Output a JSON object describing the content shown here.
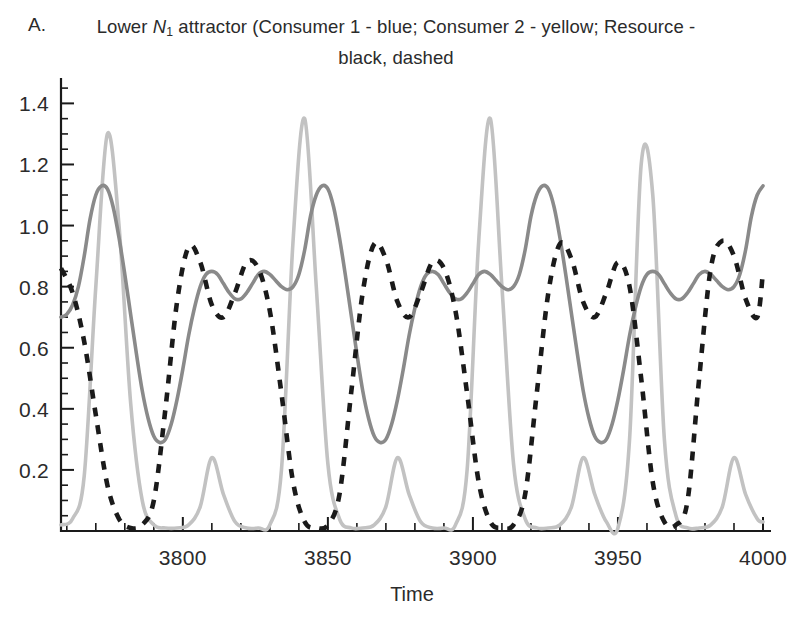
{
  "figure": {
    "panel_letter": "A.",
    "caption_prefix": "Lower ",
    "caption_var": "N",
    "caption_var_sub": "1",
    "caption_rest": " attractor (Consumer 1 - blue; Consumer 2 - yellow; Resource - black, dashed"
  },
  "chart_data": {
    "type": "line",
    "title": "Lower N1 attractor (Consumer 1 - blue; Consumer 2 - yellow; Resource - black, dashed",
    "xlabel": "Time",
    "ylabel": "",
    "xlim": [
      3758,
      4000
    ],
    "ylim": [
      0,
      1.47
    ],
    "grid": false,
    "legend_position": "none",
    "legend_in_title": true,
    "xticks_major": [
      3800,
      3850,
      3900,
      3950,
      4000
    ],
    "xticks_major_labels": [
      "3800",
      "3850",
      "3900",
      "3950",
      "4000"
    ],
    "xtick_minor_step": 10,
    "yticks_major": [
      0.2,
      0.4,
      0.6,
      0.8,
      1.0,
      1.2,
      1.4
    ],
    "yticks_major_labels": [
      "0.2",
      "0.4",
      "0.6",
      "0.8",
      "1.0",
      "1.2",
      "1.4"
    ],
    "ytick_minor_step": 0.05,
    "axis_style": "left-and-bottom-spines",
    "colors": {
      "consumer1": "#8a8a8a",
      "consumer2": "#c2c2c2",
      "resource": "#1a1a1a",
      "axis": "#1a1a1a",
      "text": "#2b2b2b",
      "background": "#ffffff"
    },
    "period": 62,
    "series": [
      {
        "name": "Consumer 1",
        "legend_label": "Consumer 1 - blue",
        "style": "solid",
        "color": "#8a8a8a",
        "x": [
          3758,
          3760,
          3762,
          3764,
          3766,
          3768,
          3770,
          3772,
          3774,
          3776,
          3778,
          3780,
          3782,
          3784,
          3786,
          3788,
          3790,
          3792,
          3794,
          3796,
          3798,
          3800,
          3802,
          3804,
          3806,
          3808,
          3810,
          3812,
          3814,
          3816,
          3818,
          3820,
          3822,
          3824,
          3826,
          3828,
          3830,
          3832,
          3834,
          3836,
          3838,
          3840,
          3842,
          3844,
          3846,
          3848,
          3850,
          3852,
          3854,
          3856,
          3858,
          3860,
          3862,
          3864,
          3866,
          3868,
          3870,
          3872,
          3874,
          3876,
          3878,
          3880,
          3882,
          3884,
          3886,
          3888,
          3890,
          3892,
          3894,
          3896,
          3898,
          3900,
          3902,
          3904,
          3906,
          3908,
          3910,
          3912,
          3914,
          3916,
          3918,
          3920,
          3922,
          3924,
          3926,
          3928,
          3930,
          3932,
          3934,
          3936,
          3938,
          3940,
          3942,
          3944,
          3946,
          3948,
          3950,
          3952,
          3954,
          3956,
          3958,
          3960,
          3962,
          3964,
          3966,
          3968,
          3970,
          3972,
          3974,
          3976,
          3978,
          3980,
          3982,
          3984,
          3986,
          3988,
          3990,
          3992,
          3994,
          3996,
          3998,
          4000
        ],
        "y": [
          0.7,
          0.71,
          0.74,
          0.8,
          0.9,
          1.02,
          1.1,
          1.13,
          1.12,
          1.06,
          0.96,
          0.84,
          0.71,
          0.58,
          0.46,
          0.37,
          0.31,
          0.29,
          0.3,
          0.35,
          0.43,
          0.53,
          0.64,
          0.73,
          0.8,
          0.84,
          0.85,
          0.84,
          0.81,
          0.78,
          0.76,
          0.76,
          0.78,
          0.81,
          0.84,
          0.85,
          0.84,
          0.82,
          0.8,
          0.79,
          0.8,
          0.84,
          0.92,
          1.03,
          1.1,
          1.13,
          1.12,
          1.06,
          0.96,
          0.84,
          0.71,
          0.58,
          0.46,
          0.37,
          0.31,
          0.29,
          0.3,
          0.35,
          0.43,
          0.53,
          0.64,
          0.73,
          0.8,
          0.84,
          0.85,
          0.84,
          0.81,
          0.78,
          0.76,
          0.76,
          0.78,
          0.81,
          0.84,
          0.85,
          0.84,
          0.82,
          0.8,
          0.79,
          0.8,
          0.84,
          0.92,
          1.03,
          1.1,
          1.13,
          1.12,
          1.06,
          0.96,
          0.84,
          0.71,
          0.58,
          0.46,
          0.37,
          0.31,
          0.29,
          0.3,
          0.35,
          0.43,
          0.53,
          0.64,
          0.73,
          0.8,
          0.84,
          0.85,
          0.84,
          0.81,
          0.78,
          0.76,
          0.76,
          0.78,
          0.81,
          0.84,
          0.85,
          0.84,
          0.82,
          0.8,
          0.79,
          0.8,
          0.84,
          0.92,
          1.03,
          1.1,
          1.13
        ]
      },
      {
        "name": "Consumer 2",
        "legend_label": "Consumer 2 - yellow",
        "style": "solid",
        "color": "#c2c2c2",
        "peak_high": 1.39,
        "peak_low": 0.25,
        "x": [
          3758,
          3762,
          3766,
          3770,
          3774,
          3778,
          3782,
          3786,
          3790,
          3794,
          3798,
          3802,
          3806,
          3810,
          3814,
          3818,
          3822,
          3826,
          3830,
          3834,
          3838,
          3842,
          3846,
          3850,
          3854,
          3858,
          3862,
          3866,
          3870,
          3874,
          3878,
          3882,
          3886,
          3890,
          3894,
          3898,
          3902,
          3906,
          3910,
          3914,
          3918,
          3922,
          3926,
          3930,
          3934,
          3938,
          3942,
          3946,
          3950,
          3954,
          3958,
          3962,
          3966,
          3970,
          3974,
          3978,
          3982,
          3986,
          3990,
          3994,
          3998,
          4000
        ],
        "y": [
          0.02,
          0.04,
          0.18,
          0.8,
          1.3,
          1.0,
          0.42,
          0.1,
          0.02,
          0.01,
          0.01,
          0.02,
          0.08,
          0.24,
          0.12,
          0.03,
          0.01,
          0.01,
          0.02,
          0.2,
          0.95,
          1.35,
          0.8,
          0.22,
          0.04,
          0.01,
          0.01,
          0.02,
          0.08,
          0.24,
          0.12,
          0.03,
          0.01,
          0.01,
          0.02,
          0.2,
          0.95,
          1.35,
          0.8,
          0.22,
          0.04,
          0.01,
          0.01,
          0.02,
          0.08,
          0.24,
          0.12,
          0.03,
          0.01,
          0.3,
          1.2,
          1.1,
          0.3,
          0.05,
          0.01,
          0.01,
          0.02,
          0.08,
          0.24,
          0.12,
          0.04,
          0.03
        ]
      },
      {
        "name": "Resource",
        "legend_label": "Resource - black, dashed",
        "style": "dashed",
        "color": "#1a1a1a",
        "peak_high": 0.96,
        "x": [
          3758,
          3762,
          3766,
          3770,
          3774,
          3778,
          3782,
          3786,
          3790,
          3794,
          3798,
          3802,
          3806,
          3810,
          3814,
          3818,
          3822,
          3826,
          3830,
          3834,
          3838,
          3842,
          3846,
          3850,
          3854,
          3858,
          3862,
          3866,
          3870,
          3874,
          3878,
          3882,
          3886,
          3890,
          3894,
          3898,
          3902,
          3906,
          3910,
          3914,
          3918,
          3922,
          3926,
          3930,
          3934,
          3938,
          3942,
          3946,
          3950,
          3954,
          3958,
          3962,
          3966,
          3970,
          3974,
          3978,
          3982,
          3986,
          3990,
          3994,
          3998,
          4000
        ],
        "y": [
          0.86,
          0.78,
          0.62,
          0.38,
          0.15,
          0.04,
          0.01,
          0.02,
          0.1,
          0.4,
          0.75,
          0.93,
          0.88,
          0.74,
          0.7,
          0.78,
          0.88,
          0.86,
          0.72,
          0.45,
          0.16,
          0.03,
          0.01,
          0.02,
          0.12,
          0.45,
          0.78,
          0.94,
          0.89,
          0.75,
          0.7,
          0.78,
          0.88,
          0.86,
          0.72,
          0.45,
          0.16,
          0.03,
          0.01,
          0.02,
          0.12,
          0.45,
          0.78,
          0.94,
          0.89,
          0.75,
          0.7,
          0.78,
          0.88,
          0.8,
          0.5,
          0.16,
          0.03,
          0.02,
          0.1,
          0.5,
          0.86,
          0.95,
          0.9,
          0.76,
          0.7,
          0.85
        ]
      }
    ]
  }
}
